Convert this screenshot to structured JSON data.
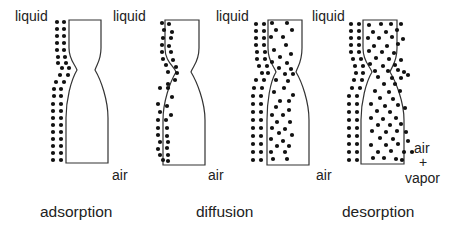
{
  "panels": [
    {
      "id": "adsorption",
      "caption": "adsorption",
      "caption_pos": [
        40,
        204
      ],
      "label_left": {
        "text": "liquid",
        "pos": [
          15,
          9
        ]
      },
      "label_right": {
        "text": "liquid",
        "pos": [
          113,
          9
        ]
      },
      "label_bottom": {
        "text": "air",
        "pos": [
          112,
          168
        ]
      },
      "pore": {
        "top": [
          69,
          101,
          20
        ],
        "neck": [
          77,
          95,
          70
        ],
        "bottom": [
          66,
          108,
          163
        ]
      },
      "dots": [
        [
          57,
          22
        ],
        [
          64,
          22
        ],
        [
          57,
          29
        ],
        [
          64,
          29
        ],
        [
          57,
          36
        ],
        [
          64,
          36
        ],
        [
          57,
          43
        ],
        [
          64,
          43
        ],
        [
          57,
          50
        ],
        [
          64,
          50
        ],
        [
          58,
          57
        ],
        [
          65,
          57
        ],
        [
          58,
          63
        ],
        [
          66,
          63
        ],
        [
          62,
          68
        ],
        [
          69,
          68
        ],
        [
          60,
          75
        ],
        [
          68,
          75
        ],
        [
          56,
          82
        ],
        [
          64,
          82
        ],
        [
          54,
          89
        ],
        [
          61,
          89
        ],
        [
          54,
          96
        ],
        [
          61,
          96
        ],
        [
          53,
          104
        ],
        [
          61,
          104
        ],
        [
          53,
          111
        ],
        [
          61,
          111
        ],
        [
          53,
          118
        ],
        [
          61,
          118
        ],
        [
          53,
          125
        ],
        [
          61,
          125
        ],
        [
          53,
          132
        ],
        [
          61,
          132
        ],
        [
          53,
          139
        ],
        [
          61,
          139
        ],
        [
          53,
          146
        ],
        [
          61,
          146
        ],
        [
          53,
          153
        ],
        [
          61,
          153
        ],
        [
          53,
          160
        ],
        [
          61,
          160
        ]
      ]
    },
    {
      "id": "diffusion",
      "caption": "diffusion",
      "caption_pos": [
        196,
        204
      ],
      "label_left": null,
      "label_right": {
        "text": "liquid",
        "pos": [
          216,
          9
        ]
      },
      "label_bottom": {
        "text": "air",
        "pos": [
          208,
          168
        ]
      },
      "pore": {
        "top": [
          165,
          199,
          20
        ],
        "neck": [
          176,
          191,
          72
        ],
        "bottom": [
          163,
          205,
          165
        ]
      },
      "dots": [
        [
          162,
          23
        ],
        [
          169,
          24
        ],
        [
          164,
          30
        ],
        [
          172,
          32
        ],
        [
          163,
          38
        ],
        [
          171,
          38
        ],
        [
          162,
          45
        ],
        [
          169,
          46
        ],
        [
          162,
          52
        ],
        [
          171,
          52
        ],
        [
          163,
          59
        ],
        [
          173,
          60
        ],
        [
          166,
          65
        ],
        [
          176,
          67
        ],
        [
          168,
          72
        ],
        [
          177,
          73
        ],
        [
          175,
          80
        ],
        [
          168,
          84
        ],
        [
          160,
          88
        ],
        [
          168,
          88
        ],
        [
          172,
          97
        ],
        [
          158,
          104
        ],
        [
          167,
          106
        ],
        [
          160,
          112
        ],
        [
          171,
          115
        ],
        [
          158,
          120
        ],
        [
          166,
          120
        ],
        [
          158,
          128
        ],
        [
          167,
          128
        ],
        [
          158,
          135
        ],
        [
          167,
          136
        ],
        [
          160,
          142
        ],
        [
          168,
          142
        ],
        [
          158,
          149
        ],
        [
          167,
          148
        ],
        [
          160,
          155
        ],
        [
          168,
          155
        ],
        [
          163,
          160
        ],
        [
          168,
          161
        ]
      ]
    },
    {
      "id": "desorption-intermediate",
      "caption": "",
      "caption_pos": null,
      "label_left": null,
      "label_right": {
        "text": "liquid",
        "pos": [
          312,
          9
        ]
      },
      "label_bottom": {
        "text": "air",
        "pos": [
          316,
          168
        ]
      },
      "pore": {
        "top": [
          268,
          302,
          20
        ],
        "neck": [
          276,
          296,
          72
        ],
        "bottom": [
          267,
          309,
          165
        ]
      },
      "dots": [
        [
          256,
          24
        ],
        [
          264,
          24
        ],
        [
          256,
          31
        ],
        [
          264,
          31
        ],
        [
          256,
          38
        ],
        [
          264,
          38
        ],
        [
          256,
          45
        ],
        [
          264,
          45
        ],
        [
          257,
          52
        ],
        [
          265,
          52
        ],
        [
          257,
          59
        ],
        [
          265,
          59
        ],
        [
          259,
          66
        ],
        [
          267,
          66
        ],
        [
          262,
          73
        ],
        [
          268,
          73
        ],
        [
          256,
          80
        ],
        [
          264,
          80
        ],
        [
          254,
          88
        ],
        [
          262,
          88
        ],
        [
          253,
          96
        ],
        [
          261,
          96
        ],
        [
          253,
          104
        ],
        [
          261,
          104
        ],
        [
          253,
          112
        ],
        [
          261,
          112
        ],
        [
          253,
          120
        ],
        [
          261,
          120
        ],
        [
          253,
          128
        ],
        [
          261,
          128
        ],
        [
          253,
          136
        ],
        [
          261,
          136
        ],
        [
          253,
          144
        ],
        [
          261,
          144
        ],
        [
          253,
          152
        ],
        [
          261,
          152
        ],
        [
          253,
          160
        ],
        [
          261,
          160
        ],
        [
          272,
          23
        ],
        [
          287,
          23
        ],
        [
          276,
          30
        ],
        [
          292,
          30
        ],
        [
          271,
          37
        ],
        [
          283,
          37
        ],
        [
          286,
          45
        ],
        [
          274,
          50
        ],
        [
          291,
          54
        ],
        [
          280,
          57
        ],
        [
          272,
          62
        ],
        [
          287,
          63
        ],
        [
          279,
          68
        ],
        [
          291,
          69
        ],
        [
          285,
          74
        ],
        [
          293,
          74
        ],
        [
          276,
          80
        ],
        [
          288,
          81
        ],
        [
          284,
          88
        ],
        [
          274,
          92
        ],
        [
          293,
          95
        ],
        [
          280,
          101
        ],
        [
          289,
          101
        ],
        [
          276,
          107
        ],
        [
          289,
          110
        ],
        [
          272,
          115
        ],
        [
          283,
          115
        ],
        [
          277,
          122
        ],
        [
          290,
          122
        ],
        [
          272,
          128
        ],
        [
          285,
          129
        ],
        [
          279,
          133
        ],
        [
          292,
          135
        ],
        [
          271,
          139
        ],
        [
          283,
          141
        ],
        [
          277,
          146
        ],
        [
          289,
          146
        ],
        [
          271,
          152
        ],
        [
          285,
          152
        ],
        [
          273,
          159
        ],
        [
          287,
          159
        ]
      ]
    },
    {
      "id": "desorption",
      "caption": "desorption",
      "caption_pos": [
        342,
        204
      ],
      "label_left": null,
      "label_right": null,
      "label_bottom": null,
      "pore": {
        "top": [
          363,
          397,
          20
        ],
        "neck": [
          372,
          390,
          72
        ],
        "bottom": [
          361,
          404,
          164
        ]
      },
      "dots": [
        [
          351,
          24
        ],
        [
          359,
          24
        ],
        [
          351,
          31
        ],
        [
          359,
          31
        ],
        [
          351,
          38
        ],
        [
          359,
          38
        ],
        [
          351,
          45
        ],
        [
          359,
          45
        ],
        [
          351,
          52
        ],
        [
          359,
          52
        ],
        [
          353,
          59
        ],
        [
          361,
          59
        ],
        [
          355,
          66
        ],
        [
          363,
          66
        ],
        [
          356,
          73
        ],
        [
          363,
          73
        ],
        [
          354,
          80
        ],
        [
          362,
          80
        ],
        [
          352,
          88
        ],
        [
          360,
          88
        ],
        [
          349,
          96
        ],
        [
          357,
          96
        ],
        [
          349,
          104
        ],
        [
          357,
          104
        ],
        [
          349,
          112
        ],
        [
          357,
          112
        ],
        [
          349,
          120
        ],
        [
          357,
          120
        ],
        [
          349,
          128
        ],
        [
          357,
          128
        ],
        [
          349,
          136
        ],
        [
          357,
          136
        ],
        [
          349,
          144
        ],
        [
          357,
          144
        ],
        [
          349,
          152
        ],
        [
          357,
          152
        ],
        [
          349,
          160
        ],
        [
          357,
          160
        ],
        [
          369,
          25
        ],
        [
          381,
          24
        ],
        [
          391,
          24
        ],
        [
          401,
          24
        ],
        [
          373,
          32
        ],
        [
          386,
          32
        ],
        [
          397,
          30
        ],
        [
          368,
          38
        ],
        [
          379,
          38
        ],
        [
          392,
          37
        ],
        [
          403,
          39
        ],
        [
          374,
          46
        ],
        [
          387,
          46
        ],
        [
          398,
          44
        ],
        [
          369,
          51
        ],
        [
          382,
          52
        ],
        [
          394,
          53
        ],
        [
          376,
          58
        ],
        [
          389,
          59
        ],
        [
          401,
          60
        ],
        [
          370,
          64
        ],
        [
          383,
          66
        ],
        [
          395,
          65
        ],
        [
          375,
          71
        ],
        [
          388,
          71
        ],
        [
          398,
          70
        ],
        [
          404,
          72
        ],
        [
          378,
          77
        ],
        [
          392,
          78
        ],
        [
          401,
          78
        ],
        [
          408,
          75
        ],
        [
          384,
          84
        ],
        [
          395,
          84
        ],
        [
          375,
          91
        ],
        [
          389,
          92
        ],
        [
          400,
          91
        ],
        [
          380,
          98
        ],
        [
          393,
          99
        ],
        [
          371,
          104
        ],
        [
          385,
          106
        ],
        [
          398,
          105
        ],
        [
          377,
          111
        ],
        [
          390,
          112
        ],
        [
          405,
          108
        ],
        [
          371,
          118
        ],
        [
          383,
          119
        ],
        [
          396,
          118
        ],
        [
          378,
          125
        ],
        [
          390,
          125
        ],
        [
          401,
          124
        ],
        [
          372,
          131
        ],
        [
          386,
          132
        ],
        [
          397,
          131
        ],
        [
          406,
          132
        ],
        [
          380,
          138
        ],
        [
          393,
          139
        ],
        [
          371,
          145
        ],
        [
          386,
          145
        ],
        [
          398,
          144
        ],
        [
          378,
          152
        ],
        [
          391,
          151
        ],
        [
          404,
          152
        ],
        [
          373,
          158
        ],
        [
          384,
          158
        ],
        [
          396,
          159
        ],
        [
          402,
          160
        ],
        [
          408,
          141
        ],
        [
          412,
          152
        ]
      ]
    }
  ],
  "side_label": {
    "lines": [
      "air",
      "+",
      "vapor"
    ],
    "pos": [
      [
        414,
        141
      ],
      [
        419,
        155
      ],
      [
        405,
        171
      ]
    ]
  }
}
